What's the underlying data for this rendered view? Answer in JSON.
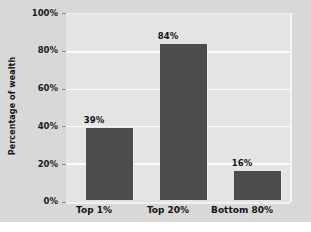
{
  "chart_data": {
    "type": "bar",
    "title": "",
    "xlabel": "",
    "ylabel": "Percentage of wealth",
    "categories": [
      "Top 1%",
      "Top 20%",
      "Bottom 80%"
    ],
    "values": [
      39,
      84,
      16
    ],
    "value_labels": [
      "39%",
      "84%",
      "16%"
    ],
    "ylim": [
      0,
      100
    ],
    "yticks": [
      0,
      20,
      40,
      60,
      80,
      100
    ],
    "ytick_labels": [
      "0%",
      "20%",
      "40%",
      "60%",
      "80%",
      "100%"
    ],
    "grid": true,
    "legend": null,
    "colors": {
      "bar": "#4c4c4c",
      "plot_background": "#e4e4e4",
      "figure_background": "#d8d8d8",
      "gridline": "#fbfbfb",
      "text": "#121212"
    }
  }
}
